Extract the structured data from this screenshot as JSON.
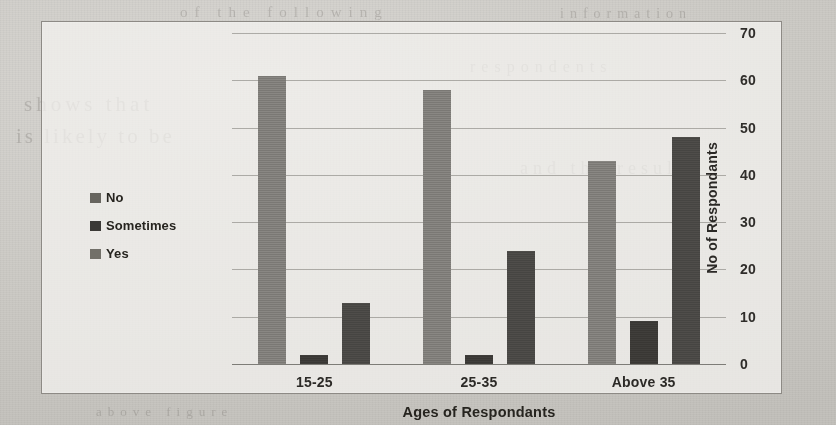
{
  "chart_data": {
    "type": "bar",
    "title": "",
    "xlabel": "Ages of Respondants",
    "ylabel": "No of Respondants",
    "categories": [
      "15-25",
      "25-35",
      "Above 35"
    ],
    "series": [
      {
        "name": "No",
        "values": [
          61,
          58,
          43
        ],
        "color": "#807e7a"
      },
      {
        "name": "Sometimes",
        "values": [
          2,
          2,
          9
        ],
        "color": "#3c3a37"
      },
      {
        "name": "Yes",
        "values": [
          13,
          24,
          48
        ],
        "color": "#4a4845"
      }
    ],
    "ylim": [
      0,
      70
    ],
    "ytick_step": 10,
    "yticks": [
      "0",
      "10",
      "20",
      "30",
      "40",
      "50",
      "60",
      "70"
    ],
    "y_axis_position": "right",
    "grid": true,
    "legend_position": "inside-left"
  },
  "legend": {
    "items": [
      {
        "label": "No"
      },
      {
        "label": "Sometimes"
      },
      {
        "label": "Yes"
      }
    ]
  },
  "background_text": {
    "line1": "of the following",
    "line2": "information",
    "line3": "shows that",
    "line4": "is likely to be",
    "line5": "and the results",
    "line6": "respondents",
    "line7": "above figure"
  }
}
